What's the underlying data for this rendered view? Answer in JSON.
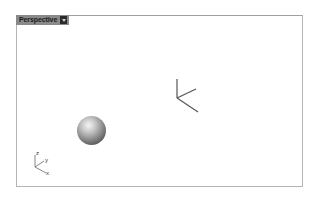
{
  "viewport": {
    "name": "Perspective",
    "menu_icon": "dropdown-arrow-icon"
  },
  "scene": {
    "objects": [
      {
        "type": "sphere",
        "label": "sphere"
      },
      {
        "type": "point-gizmo",
        "label": "object-axes"
      }
    ]
  },
  "world_axes": {
    "z_label": "z",
    "y_label": "y",
    "x_label": "x"
  },
  "colors": {
    "tab_bg": "#8a8a8a",
    "border": "#b4b4b4",
    "axis_line": "#555555"
  }
}
